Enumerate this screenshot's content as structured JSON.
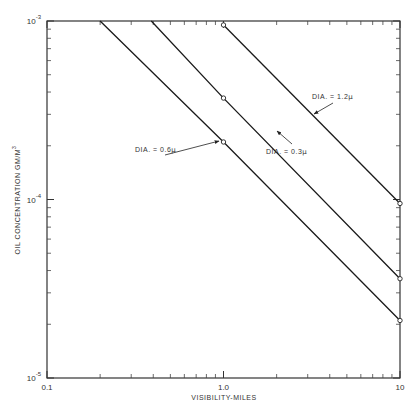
{
  "chart_data": {
    "type": "line",
    "title": "",
    "xlabel": "VISIBILITY-MILES",
    "ylabel": "OIL CONCENTRATION GM/M",
    "ylabel_sup": "3",
    "xscale": "log",
    "yscale": "log",
    "xlim": [
      0.1,
      10
    ],
    "ylim": [
      1e-05,
      0.001
    ],
    "x_ticks": [
      {
        "value": 0.1,
        "label": "0.1"
      },
      {
        "value": 1.0,
        "label": "1.0"
      },
      {
        "value": 10,
        "label": "10"
      }
    ],
    "y_ticks": [
      {
        "value": 1e-05,
        "base": "10",
        "exp": "-5"
      },
      {
        "value": 0.0001,
        "base": "10",
        "exp": "-4"
      },
      {
        "value": 0.001,
        "base": "10",
        "exp": "-3"
      }
    ],
    "grid": false,
    "series": [
      {
        "name": "DIA.=0.6μ",
        "label": "DIA. = 0.6",
        "unit": "μ",
        "points": [
          [
            0.2,
            0.001
          ],
          [
            1.0,
            0.00021
          ],
          [
            10,
            2.1e-05
          ]
        ],
        "markers": [
          [
            1.0,
            0.00021
          ],
          [
            10,
            2.1e-05
          ]
        ]
      },
      {
        "name": "DIA.=0.3μ",
        "label": "DIA. = 0.3",
        "unit": "μ",
        "points": [
          [
            0.39,
            0.001
          ],
          [
            1.0,
            0.00037
          ],
          [
            10,
            3.6e-05
          ]
        ],
        "markers": [
          [
            1.0,
            0.00037
          ],
          [
            10,
            3.6e-05
          ]
        ]
      },
      {
        "name": "DIA.=1.2μ",
        "label": "DIA. = 1.2",
        "unit": "μ",
        "points": [
          [
            1.0,
            0.00095
          ],
          [
            10,
            9.5e-05
          ]
        ],
        "markers": [
          [
            1.0,
            0.00095
          ],
          [
            10,
            9.5e-05
          ]
        ]
      }
    ],
    "legend": "inline annotations with arrows"
  }
}
